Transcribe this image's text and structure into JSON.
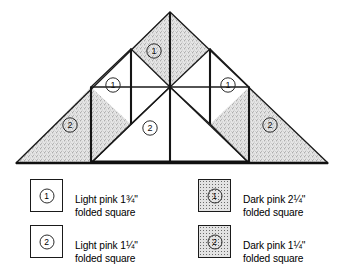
{
  "diagram": {
    "shape": "triangle-pyramid-layout",
    "labels": [
      {
        "id": "peak-center",
        "number": "1",
        "x": 154,
        "y": 51,
        "fill": "dark"
      },
      {
        "id": "left-inner",
        "number": "1",
        "x": 113,
        "y": 85,
        "fill": "light"
      },
      {
        "id": "right-inner",
        "number": "1",
        "x": 228,
        "y": 85,
        "fill": "light"
      },
      {
        "id": "left-outer",
        "number": "2",
        "x": 70,
        "y": 125,
        "fill": "dark"
      },
      {
        "id": "center-base",
        "number": "2",
        "x": 170,
        "y": 128,
        "fill": "light"
      },
      {
        "id": "right-outer",
        "number": "2",
        "x": 270,
        "y": 125,
        "fill": "dark"
      }
    ],
    "geometry": {
      "apex": [
        170,
        12
      ],
      "base_left": [
        16,
        163
      ],
      "base_right": [
        328,
        163
      ],
      "verticals_x": [
        91,
        131,
        170,
        210,
        249
      ]
    }
  },
  "legend": {
    "columns": [
      {
        "id": "light-pink-column",
        "entries": [
          {
            "number": "1",
            "fill": "light",
            "line1": "Light pink 1¾\"",
            "line2": "folded square"
          },
          {
            "number": "2",
            "fill": "light",
            "line1": "Light pink 1¼\"",
            "line2": "folded square"
          }
        ]
      },
      {
        "id": "dark-pink-column",
        "entries": [
          {
            "number": "1",
            "fill": "dark",
            "line1": "Dark pink 2¼\"",
            "line2": "folded square"
          },
          {
            "number": "2",
            "fill": "dark",
            "line1": "Dark pink 1¼\"",
            "line2": "folded square"
          }
        ]
      }
    ]
  },
  "colors": {
    "line": "#1a1a1a",
    "light_fill": "#ffffff",
    "dark_fill": "#e3e3e3",
    "stipple": "#6f6f6f",
    "background": "#ffffff"
  }
}
